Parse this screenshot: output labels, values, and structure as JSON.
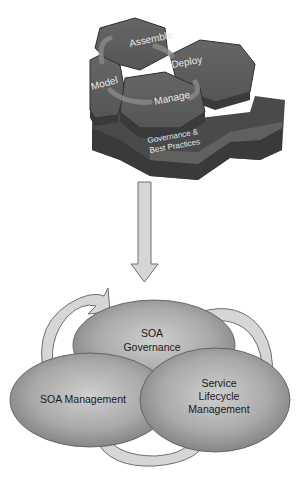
{
  "hexagon_model": {
    "phases": [
      {
        "id": "assemble",
        "label": "Assemble"
      },
      {
        "id": "deploy",
        "label": "Deploy"
      },
      {
        "id": "model",
        "label": "Model"
      },
      {
        "id": "manage",
        "label": "Manage"
      }
    ],
    "base": {
      "line1": "Governance &",
      "line2": "Best Practices"
    }
  },
  "ellipses": {
    "governance": {
      "line1": "SOA",
      "line2": "Governance"
    },
    "management": {
      "line1": "SOA Management"
    },
    "lifecycle": {
      "line1": "Service",
      "line2": "Lifecycle",
      "line3": "Management"
    }
  },
  "colors": {
    "hex_top": "#5a5a5a",
    "hex_side": "#3c3c3c",
    "arrow_fill": "#d6d6d6",
    "ellipse_mid": "#b8b8b8",
    "ellipse_edge": "#7a7a7a"
  }
}
